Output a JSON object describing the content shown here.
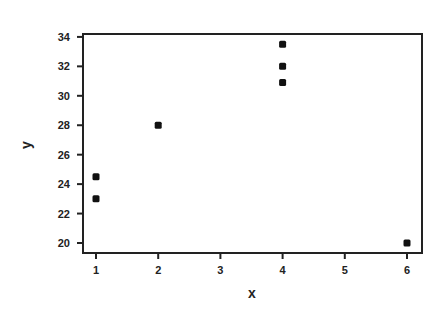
{
  "chart_data": {
    "type": "scatter",
    "title": "",
    "xlabel": "x",
    "ylabel": "y",
    "xlim": [
      0.8,
      6.25
    ],
    "ylim": [
      19.3,
      34.3
    ],
    "xticks": [
      1,
      2,
      3,
      4,
      5,
      6
    ],
    "yticks": [
      20,
      22,
      24,
      26,
      28,
      30,
      32,
      34
    ],
    "grid": false,
    "legend": null,
    "points": [
      {
        "x": 1,
        "y": 24.5
      },
      {
        "x": 1,
        "y": 23.0
      },
      {
        "x": 2,
        "y": 28.0
      },
      {
        "x": 4,
        "y": 33.5
      },
      {
        "x": 4,
        "y": 32.0
      },
      {
        "x": 4,
        "y": 30.9
      },
      {
        "x": 6,
        "y": 20.0
      }
    ]
  },
  "colors": {
    "ink": "#222222",
    "background": "#ffffff"
  }
}
